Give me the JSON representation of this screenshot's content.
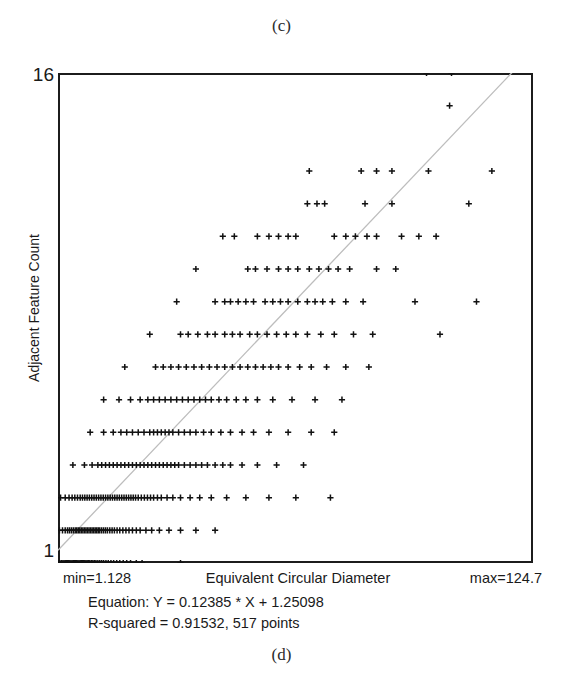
{
  "figure": {
    "panel_label_top": "(c)",
    "panel_label_bottom": "(d)"
  },
  "axes": {
    "y_title": "Adjacent Feature Count",
    "y_tick_top": "16",
    "y_tick_bottom": "1",
    "x_title": "Equivalent Circular Diameter",
    "x_min_label": "min=1.128",
    "x_max_label": "max=124.7"
  },
  "stats": {
    "equation": "Equation: Y = 0.12385 * X + 1.25098",
    "rsquared": "R-squared = 0.91532, 517 points"
  },
  "chart_data": {
    "type": "scatter",
    "title": "(c)",
    "xlabel": "Equivalent Circular Diameter",
    "ylabel": "Adjacent Feature Count",
    "xlim": [
      1.128,
      124.7
    ],
    "ylim": [
      1,
      16
    ],
    "grid": false,
    "legend": null,
    "marker": "plus",
    "marker_color": "#111111",
    "n_points": 517,
    "fit": {
      "type": "linear",
      "slope": 0.12385,
      "intercept": 1.25098,
      "r_squared": 0.91532,
      "color": "#bdbdbd",
      "x_start": 1.128,
      "x_end": 124.7,
      "y_start": 1.39,
      "y_end": 16.69
    },
    "annotations": [
      "min=1.128",
      "max=124.7",
      "Equation: Y = 0.12385 * X + 1.25098",
      "R-squared = 0.91532, 517 points"
    ],
    "series": [
      {
        "name": "features",
        "note": "y is integer-valued; points form horizontal rows. x in data units (Equivalent Circular Diameter).",
        "rows": [
          {
            "y": 16,
            "x": [
              97.0,
              103.5
            ]
          },
          {
            "y": 15,
            "x": [
              103.0
            ]
          },
          {
            "y": 13,
            "x": [
              66.5,
              80.0,
              84.0,
              88.0,
              97.5,
              114.0
            ]
          },
          {
            "y": 12,
            "x": [
              66.0,
              68.5,
              70.5,
              81.0,
              88.0,
              108.0
            ]
          },
          {
            "y": 11,
            "x": [
              44.0,
              47.0,
              53.0,
              56.0,
              58.5,
              61.0,
              63.0,
              73.0,
              76.0,
              78.5,
              81.5,
              84.0,
              90.5,
              95.0,
              99.5
            ]
          },
          {
            "y": 10,
            "x": [
              37.0,
              50.5,
              52.5,
              55.5,
              58.5,
              61.0,
              63.5,
              66.5,
              69.0,
              71.5,
              74.0,
              77.0,
              84.0,
              89.0
            ]
          },
          {
            "y": 9,
            "x": [
              32.0,
              42.0,
              44.5,
              46.0,
              48.0,
              50.0,
              52.0,
              55.0,
              57.0,
              59.0,
              61.0,
              63.5,
              66.0,
              68.0,
              70.0,
              72.5,
              76.0,
              80.5,
              94.0,
              110.0
            ]
          },
          {
            "y": 8,
            "x": [
              25.0,
              33.0,
              35.0,
              37.5,
              40.0,
              42.0,
              44.5,
              46.5,
              48.5,
              51.0,
              53.0,
              55.5,
              58.0,
              60.5,
              63.0,
              66.0,
              69.5,
              73.0,
              78.0,
              83.0,
              100.5
            ]
          },
          {
            "y": 7,
            "x": [
              18.5,
              26.5,
              28.5,
              30.5,
              32.5,
              34.5,
              36.5,
              38.5,
              40.5,
              42.5,
              44.5,
              46.5,
              48.5,
              50.5,
              52.5,
              54.5,
              56.5,
              58.5,
              61.0,
              64.0,
              67.0,
              71.0,
              76.0,
              82.0
            ]
          },
          {
            "y": 6,
            "x": [
              13.0,
              17.0,
              20.0,
              22.5,
              24.5,
              26.0,
              27.5,
              29.0,
              30.5,
              32.0,
              33.5,
              35.0,
              36.5,
              38.0,
              39.5,
              41.0,
              43.0,
              45.0,
              47.5,
              50.0,
              53.0,
              57.0,
              62.0,
              68.0,
              75.0
            ]
          },
          {
            "y": 5,
            "x": [
              9.5,
              13.0,
              15.5,
              17.5,
              19.0,
              20.5,
              22.0,
              23.5,
              25.0,
              26.0,
              27.0,
              28.0,
              29.0,
              30.0,
              31.0,
              32.5,
              34.0,
              35.5,
              37.0,
              39.0,
              41.0,
              43.5,
              46.0,
              49.0,
              52.0,
              56.0,
              61.0,
              67.0,
              73.0
            ]
          },
          {
            "y": 4,
            "x": [
              5.0,
              8.0,
              10.0,
              11.5,
              12.5,
              13.5,
              14.5,
              15.5,
              16.5,
              17.5,
              18.5,
              19.5,
              20.5,
              21.5,
              22.5,
              23.5,
              24.5,
              25.5,
              26.5,
              27.5,
              28.5,
              29.5,
              30.5,
              31.5,
              32.5,
              34.0,
              35.5,
              37.0,
              38.5,
              40.0,
              42.0,
              44.0,
              46.0,
              49.0,
              53.0,
              58.0,
              65.0
            ]
          },
          {
            "y": 3,
            "x": [
              1.8,
              3.0,
              4.0,
              4.8,
              5.5,
              6.2,
              6.9,
              7.5,
              8.1,
              8.7,
              9.3,
              9.9,
              10.5,
              11.1,
              11.7,
              12.3,
              12.9,
              13.5,
              14.1,
              14.7,
              15.3,
              15.9,
              16.5,
              17.1,
              17.7,
              18.3,
              18.9,
              19.5,
              20.1,
              20.7,
              21.3,
              22.0,
              22.8,
              23.6,
              24.4,
              25.2,
              26.0,
              27.0,
              28.0,
              29.5,
              31.0,
              33.0,
              35.5,
              38.0,
              41.0,
              45.0,
              50.0,
              56.0,
              63.0,
              72.0
            ]
          },
          {
            "y": 2,
            "x": [
              1.5,
              2.3,
              3.0,
              3.6,
              4.1,
              4.6,
              5.1,
              5.6,
              6.0,
              6.4,
              6.8,
              7.2,
              7.6,
              8.0,
              8.4,
              8.8,
              9.2,
              9.6,
              10.0,
              10.4,
              10.8,
              11.2,
              11.6,
              12.0,
              12.5,
              13.0,
              13.5,
              14.0,
              14.6,
              15.2,
              15.8,
              16.5,
              17.2,
              18.0,
              18.8,
              19.6,
              20.5,
              21.5,
              22.5,
              24.0,
              25.5,
              27.5,
              30.0,
              33.0,
              37.0,
              42.0
            ]
          },
          {
            "y": 1,
            "x": [
              1.13,
              1.6,
              2.0,
              2.4,
              2.7,
              3.0,
              3.3,
              3.6,
              3.9,
              4.2,
              4.5,
              4.8,
              5.1,
              5.4,
              5.7,
              6.0,
              6.3,
              6.6,
              6.9,
              7.2,
              7.5,
              7.8,
              8.1,
              8.4,
              8.7,
              9.0,
              9.4,
              9.8,
              10.2,
              10.6,
              11.0,
              11.5,
              12.0,
              12.5,
              13.0,
              13.6,
              14.2,
              14.9,
              15.6,
              16.4,
              17.2,
              18.1,
              19.0,
              20.0,
              21.5,
              23.0,
              33.0
            ]
          }
        ]
      }
    ]
  }
}
